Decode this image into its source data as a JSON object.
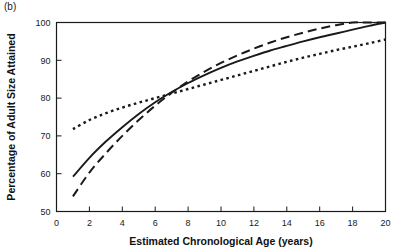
{
  "figure": {
    "panel_label": "(b)"
  },
  "chart_data": {
    "type": "line",
    "title": "",
    "panel_label": "(b)",
    "xlabel": "Estimated Chronological Age (years)",
    "ylabel": "Percentage of Adult Size Attained",
    "xlim": [
      0,
      20
    ],
    "ylim": [
      50,
      100
    ],
    "xticks": [
      0,
      2,
      4,
      6,
      8,
      10,
      12,
      14,
      16,
      18,
      20
    ],
    "yticks": [
      50,
      60,
      70,
      80,
      90,
      100
    ],
    "xtick_labels": [
      "0",
      "2",
      "4",
      "6",
      "8",
      "10",
      "12",
      "14",
      "16",
      "18",
      "20"
    ],
    "ytick_labels": [
      "50",
      "60",
      "70",
      "80",
      "90",
      "100"
    ],
    "grid": false,
    "legend": "none",
    "line_color": "#1a1a1a",
    "x": [
      1,
      2,
      3,
      4,
      5,
      6,
      7,
      8,
      9,
      10,
      11,
      12,
      13,
      14,
      15,
      16,
      17,
      18,
      19,
      20
    ],
    "series": [
      {
        "name": "dotted-curve",
        "style": "dotted",
        "values": [
          71.8,
          74.2,
          76.0,
          77.5,
          78.8,
          80.0,
          81.2,
          82.4,
          83.6,
          84.8,
          86.0,
          87.2,
          88.4,
          89.6,
          90.7,
          91.7,
          92.7,
          93.6,
          94.5,
          95.5
        ]
      },
      {
        "name": "solid-curve",
        "style": "solid",
        "values": [
          59.2,
          64.2,
          68.5,
          72.3,
          75.8,
          78.9,
          81.6,
          84.0,
          86.1,
          88.0,
          89.7,
          91.2,
          92.6,
          93.8,
          95.0,
          96.1,
          97.1,
          98.1,
          99.1,
          100.0
        ]
      },
      {
        "name": "dashed-curve",
        "style": "dashed",
        "values": [
          54.0,
          60.3,
          65.4,
          70.0,
          74.2,
          78.0,
          81.4,
          84.4,
          87.0,
          89.3,
          91.3,
          93.1,
          94.7,
          96.1,
          97.3,
          98.4,
          99.3,
          100.0,
          100.0,
          100.0
        ]
      }
    ]
  }
}
